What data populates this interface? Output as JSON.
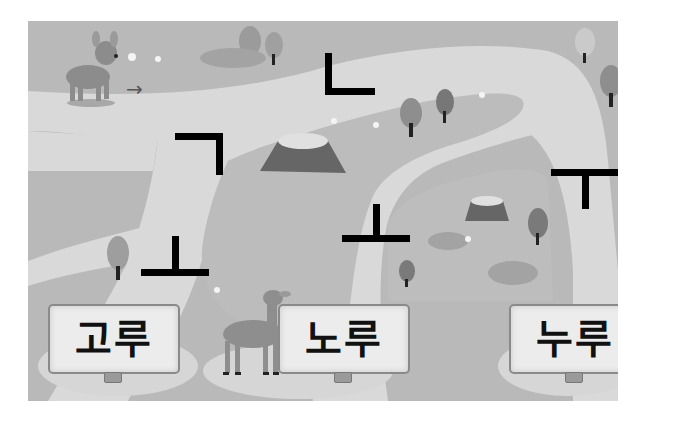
{
  "game": {
    "type": "maze-word-puzzle",
    "start_arrow": "→",
    "jamo_tiles": [
      {
        "id": "giyeok",
        "glyph": "ㄱ"
      },
      {
        "id": "nieun",
        "glyph": "ㄴ"
      },
      {
        "id": "o-vowel-left",
        "glyph": "ㅗ"
      },
      {
        "id": "o-vowel-middle",
        "glyph": "ㅗ"
      },
      {
        "id": "u-vowel",
        "glyph": "ㅜ"
      }
    ],
    "answer_signs": [
      {
        "id": "goru",
        "word": "고루"
      },
      {
        "id": "noru",
        "word": "노루"
      },
      {
        "id": "nuru",
        "word": "누루"
      }
    ]
  },
  "colors": {
    "grass": "#b9b9b9",
    "path": "#d9d9d9",
    "sign_face": "#ececec",
    "jamo_stroke": "#000000"
  }
}
